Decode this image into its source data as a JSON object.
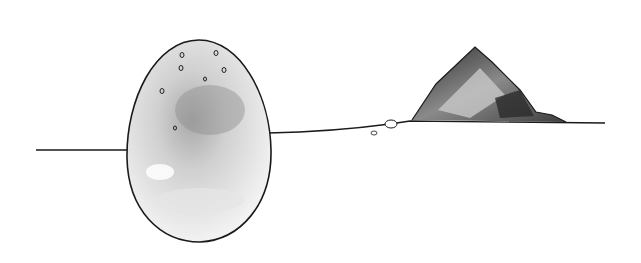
{
  "scene": {
    "description": "Line drawing of a large speckled egg-shaped stone standing upright across a horizon line, with a small crystalline mountain on the right and two small pebbles",
    "colors": {
      "background": "#ffffff",
      "line": "#1a1a1a",
      "shade_dark": "#3a3a3a",
      "shade_mid": "#9a9a9a",
      "shade_light": "#d8d8d8"
    }
  }
}
